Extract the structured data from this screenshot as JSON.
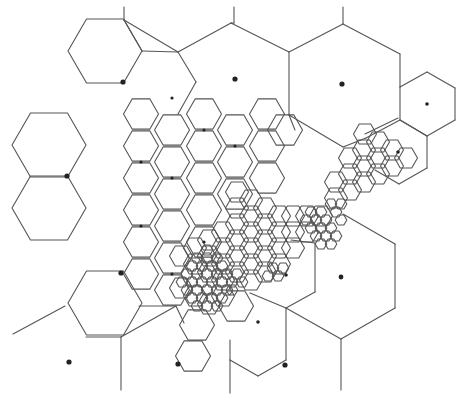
{
  "diagram": {
    "type": "adaptive-hexagonal-voronoi-mesh",
    "width": 462,
    "height": 398,
    "stroke_color": "#555555",
    "site_color": "#222222",
    "hex_groups": [
      {
        "name": "large",
        "radius": 37,
        "centers": [
          [
            105,
            51
          ],
          [
            49,
            145
          ],
          [
            49,
            208
          ],
          [
            105,
            303
          ]
        ]
      },
      {
        "name": "large-upper-right",
        "radius": 37,
        "centers": []
      },
      {
        "name": "medium",
        "radius": 17.5,
        "centers": [
          [
            141,
            114
          ],
          [
            172,
            130
          ],
          [
            141,
            146
          ],
          [
            204,
            114
          ],
          [
            235,
            130
          ],
          [
            204,
            146
          ],
          [
            267,
            114
          ],
          [
            172,
            162
          ],
          [
            235,
            162
          ],
          [
            141,
            178
          ],
          [
            204,
            178
          ],
          [
            267,
            146
          ],
          [
            172,
            194
          ],
          [
            235,
            194
          ],
          [
            141,
            210
          ],
          [
            204,
            210
          ],
          [
            172,
            226
          ],
          [
            267,
            178
          ],
          [
            141,
            242
          ],
          [
            172,
            258
          ],
          [
            204,
            242
          ],
          [
            141,
            274
          ],
          [
            172,
            290
          ],
          [
            197,
            325
          ],
          [
            193,
            356
          ],
          [
            236,
            306
          ],
          [
            285,
            130
          ]
        ]
      },
      {
        "name": "small",
        "radius": 11.5,
        "centers": [
          [
            237,
            192
          ],
          [
            251,
            200
          ],
          [
            237,
            208
          ],
          [
            265,
            208
          ],
          [
            251,
            216
          ],
          [
            279,
            216
          ],
          [
            237,
            224
          ],
          [
            265,
            224
          ],
          [
            293,
            216
          ],
          [
            251,
            232
          ],
          [
            279,
            232
          ],
          [
            307,
            216
          ],
          [
            223,
            232
          ],
          [
            237,
            240
          ],
          [
            265,
            240
          ],
          [
            293,
            232
          ],
          [
            307,
            232
          ],
          [
            321,
            216
          ],
          [
            251,
            248
          ],
          [
            279,
            248
          ],
          [
            209,
            240
          ],
          [
            223,
            248
          ],
          [
            237,
            256
          ],
          [
            265,
            256
          ],
          [
            293,
            248
          ],
          [
            195,
            248
          ],
          [
            209,
            256
          ],
          [
            223,
            264
          ],
          [
            251,
            264
          ],
          [
            279,
            264
          ],
          [
            195,
            264
          ],
          [
            209,
            272
          ],
          [
            237,
            272
          ],
          [
            265,
            272
          ],
          [
            251,
            280
          ],
          [
            223,
            280
          ],
          [
            181,
            256
          ],
          [
            181,
            288
          ],
          [
            195,
            296
          ],
          [
            209,
            304
          ],
          [
            223,
            296
          ],
          [
            336,
            198
          ],
          [
            350,
            190
          ],
          [
            336,
            182
          ],
          [
            350,
            174
          ],
          [
            364,
            166
          ],
          [
            350,
            158
          ],
          [
            364,
            150
          ],
          [
            378,
            158
          ],
          [
            364,
            182
          ],
          [
            378,
            142
          ],
          [
            378,
            174
          ],
          [
            392,
            150
          ],
          [
            392,
            166
          ],
          [
            406,
            158
          ],
          [
            365,
            134
          ]
        ]
      },
      {
        "name": "tiny",
        "radius": 5.8,
        "centers": [
          [
            197,
            258
          ],
          [
            207,
            258
          ],
          [
            202,
            266
          ],
          [
            212,
            266
          ],
          [
            192,
            266
          ],
          [
            197,
            274
          ],
          [
            207,
            274
          ],
          [
            217,
            274
          ],
          [
            187,
            274
          ],
          [
            192,
            282
          ],
          [
            202,
            282
          ],
          [
            212,
            282
          ],
          [
            222,
            282
          ],
          [
            182,
            282
          ],
          [
            187,
            290
          ],
          [
            197,
            290
          ],
          [
            207,
            290
          ],
          [
            217,
            290
          ],
          [
            227,
            290
          ],
          [
            192,
            298
          ],
          [
            202,
            298
          ],
          [
            212,
            298
          ],
          [
            222,
            298
          ],
          [
            232,
            290
          ],
          [
            207,
            250
          ],
          [
            217,
            258
          ],
          [
            222,
            266
          ],
          [
            227,
            274
          ],
          [
            232,
            282
          ],
          [
            237,
            274
          ],
          [
            242,
            282
          ],
          [
            197,
            306
          ],
          [
            207,
            306
          ],
          [
            217,
            306
          ],
          [
            311,
            212
          ],
          [
            321,
            212
          ],
          [
            316,
            220
          ],
          [
            326,
            220
          ],
          [
            306,
            220
          ],
          [
            311,
            228
          ],
          [
            321,
            228
          ],
          [
            331,
            228
          ],
          [
            316,
            236
          ],
          [
            326,
            236
          ],
          [
            336,
            236
          ],
          [
            331,
            244
          ],
          [
            321,
            244
          ],
          [
            341,
            220
          ],
          [
            336,
            212
          ],
          [
            331,
            204
          ],
          [
            341,
            204
          ],
          [
            273,
            268
          ],
          [
            268,
            276
          ],
          [
            278,
            276
          ],
          [
            283,
            268
          ]
        ]
      }
    ],
    "edges": [
      [
        [
          124,
          7
        ],
        [
          124,
          20
        ]
      ],
      [
        [
          124,
          20
        ],
        [
          142,
          51
        ]
      ],
      [
        [
          124,
          20
        ],
        [
          178,
          52
        ]
      ],
      [
        [
          142,
          51
        ],
        [
          178,
          52
        ]
      ],
      [
        [
          178,
          52
        ],
        [
          231,
          23
        ]
      ],
      [
        [
          178,
          52
        ],
        [
          196,
          82
        ]
      ],
      [
        [
          196,
          82
        ],
        [
          178,
          114
        ]
      ],
      [
        [
          231,
          23
        ],
        [
          289,
          52
        ]
      ],
      [
        [
          234,
          7
        ],
        [
          234,
          23
        ]
      ],
      [
        [
          231,
          23
        ],
        [
          234,
          23
        ]
      ],
      [
        [
          289,
          52
        ],
        [
          289,
          115
        ]
      ],
      [
        [
          289,
          52
        ],
        [
          343,
          24
        ]
      ],
      [
        [
          343,
          24
        ],
        [
          343,
          7
        ]
      ],
      [
        [
          343,
          24
        ],
        [
          400,
          54
        ]
      ],
      [
        [
          400,
          54
        ],
        [
          400,
          87
        ]
      ],
      [
        [
          400,
          87
        ],
        [
          427,
          72
        ]
      ],
      [
        [
          427,
          72
        ],
        [
          455,
          88
        ]
      ],
      [
        [
          455,
          88
        ],
        [
          455,
          120
        ]
      ],
      [
        [
          455,
          120
        ],
        [
          427,
          136
        ]
      ],
      [
        [
          427,
          136
        ],
        [
          400,
          120
        ]
      ],
      [
        [
          400,
          120
        ],
        [
          400,
          87
        ]
      ],
      [
        [
          400,
          120
        ],
        [
          427,
          136
        ]
      ],
      [
        [
          427,
          136
        ],
        [
          427,
          168
        ]
      ],
      [
        [
          427,
          168
        ],
        [
          399,
          184
        ]
      ],
      [
        [
          399,
          184
        ],
        [
          375,
          170
        ]
      ],
      [
        [
          400,
          120
        ],
        [
          366,
          138
        ]
      ],
      [
        [
          398,
          118
        ],
        [
          365,
          134
        ]
      ],
      [
        [
          289,
          115
        ],
        [
          343,
          147
        ]
      ],
      [
        [
          343,
          147
        ],
        [
          366,
          138
        ]
      ],
      [
        [
          289,
          115
        ],
        [
          295,
          130
        ]
      ],
      [
        [
          343,
          214
        ],
        [
          395,
          244
        ]
      ],
      [
        [
          395,
          244
        ],
        [
          395,
          308
        ]
      ],
      [
        [
          395,
          308
        ],
        [
          341,
          339
        ]
      ],
      [
        [
          341,
          339
        ],
        [
          341,
          390
        ]
      ],
      [
        [
          341,
          339
        ],
        [
          286,
          308
        ]
      ],
      [
        [
          286,
          308
        ],
        [
          250,
          293
        ]
      ],
      [
        [
          286,
          308
        ],
        [
          286,
          360
        ]
      ],
      [
        [
          286,
          308
        ],
        [
          315,
          292
        ]
      ],
      [
        [
          315,
          292
        ],
        [
          315,
          243
        ]
      ],
      [
        [
          315,
          243
        ],
        [
          291,
          240
        ]
      ],
      [
        [
          286,
          360
        ],
        [
          258,
          376
        ]
      ],
      [
        [
          258,
          376
        ],
        [
          230,
          360
        ]
      ],
      [
        [
          230,
          360
        ],
        [
          230,
          393
        ]
      ],
      [
        [
          230,
          360
        ],
        [
          230,
          340
        ]
      ],
      [
        [
          176,
          306
        ],
        [
          121,
          337
        ]
      ],
      [
        [
          121,
          337
        ],
        [
          121,
          390
        ]
      ],
      [
        [
          121,
          337
        ],
        [
          86,
          337
        ]
      ],
      [
        [
          139,
          306
        ],
        [
          176,
          306
        ]
      ],
      [
        [
          65,
          306
        ],
        [
          13,
          334
        ]
      ],
      [
        [
          176,
          306
        ],
        [
          184,
          323
        ]
      ]
    ],
    "sites": [
      {
        "x": 123,
        "y": 82,
        "r": 2.6
      },
      {
        "x": 67,
        "y": 176,
        "r": 2.6
      },
      {
        "x": 121,
        "y": 273,
        "r": 2.6
      },
      {
        "x": 235,
        "y": 79,
        "r": 2.6
      },
      {
        "x": 342,
        "y": 84,
        "r": 2.6
      },
      {
        "x": 427,
        "y": 104,
        "r": 1.8
      },
      {
        "x": 398,
        "y": 152,
        "r": 1.8
      },
      {
        "x": 286,
        "y": 275,
        "r": 1.8
      },
      {
        "x": 341,
        "y": 277,
        "r": 2.4
      },
      {
        "x": 258,
        "y": 322,
        "r": 1.8
      },
      {
        "x": 69,
        "y": 362,
        "r": 2.6
      },
      {
        "x": 178,
        "y": 364,
        "r": 2.6
      },
      {
        "x": 285,
        "y": 365,
        "r": 2.6
      },
      {
        "x": 172,
        "y": 98,
        "r": 1.6
      },
      {
        "x": 204,
        "y": 130,
        "r": 1.6
      },
      {
        "x": 141,
        "y": 162,
        "r": 1.6
      },
      {
        "x": 235,
        "y": 146,
        "r": 1.6
      },
      {
        "x": 172,
        "y": 178,
        "r": 1.6
      },
      {
        "x": 204,
        "y": 242,
        "r": 1.6
      },
      {
        "x": 141,
        "y": 226,
        "r": 1.6
      },
      {
        "x": 172,
        "y": 274,
        "r": 1.6
      }
    ]
  }
}
